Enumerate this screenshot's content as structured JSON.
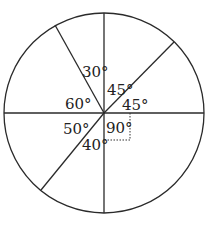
{
  "diagram": {
    "type": "circle-with-central-angles",
    "center": [
      104,
      113
    ],
    "radius": 100,
    "spokes_deg_from_north_clockwise": [
      0,
      53,
      90,
      180,
      233,
      270,
      331
    ],
    "angles": [
      {
        "id": "a30",
        "label": "30°",
        "x": 82,
        "y": 77
      },
      {
        "id": "a45-upper",
        "label": "45°",
        "x": 107,
        "y": 95
      },
      {
        "id": "a60",
        "label": "60°",
        "x": 65,
        "y": 109
      },
      {
        "id": "a45-right",
        "label": "45°",
        "x": 122,
        "y": 110
      },
      {
        "id": "a50",
        "label": "50°",
        "x": 63,
        "y": 134
      },
      {
        "id": "a90",
        "label": "90°",
        "x": 106,
        "y": 133
      },
      {
        "id": "a40",
        "label": "40°",
        "x": 82,
        "y": 150
      }
    ],
    "right_angle_marker": true
  }
}
